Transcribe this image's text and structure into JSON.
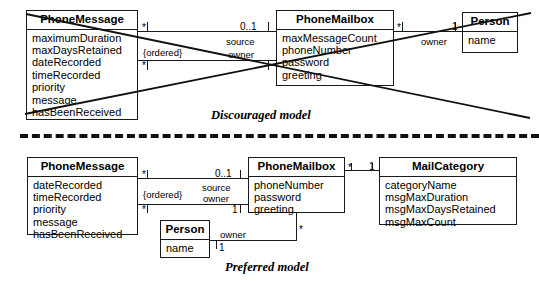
{
  "diagram": {
    "top": {
      "caption": "Discouraged model",
      "classes": [
        {
          "name": "PhoneMessage",
          "attributes": [
            "maximumDuration",
            "maxDaysRetained",
            "dateRecorded",
            "timeRecorded",
            "priority",
            "message",
            "hasBeenReceived"
          ]
        },
        {
          "name": "PhoneMailbox",
          "attributes": [
            "maxMessageCount",
            "phoneNumber",
            "password",
            "greeting"
          ]
        },
        {
          "name": "Person",
          "attributes": [
            "name"
          ]
        }
      ],
      "edge_labels": {
        "ordered": "{ordered}",
        "source": "source",
        "owner": "owner",
        "owner2": "owner"
      },
      "multiplicities": {
        "msg_star_top": "*",
        "msg_star_bottom": "*",
        "mailbox_source": "0..1",
        "mailbox_owner": "1",
        "mailbox_star": "*",
        "person_one": "1"
      }
    },
    "bottom": {
      "caption": "Preferred model",
      "classes": [
        {
          "name": "PhoneMessage",
          "attributes": [
            "dateRecorded",
            "timeRecorded",
            "priority",
            "message",
            "hasBeenReceived"
          ]
        },
        {
          "name": "PhoneMailbox",
          "attributes": [
            "phoneNumber",
            "password",
            "greeting"
          ]
        },
        {
          "name": "Person",
          "attributes": [
            "name"
          ]
        },
        {
          "name": "MailCategory",
          "attributes": [
            "categoryName",
            "msgMaxDuration",
            "msgMaxDaysRetained",
            "msgMaxCount"
          ]
        }
      ],
      "edge_labels": {
        "ordered": "{ordered}",
        "source": "source",
        "owner": "owner",
        "person_owner": "owner"
      },
      "multiplicities": {
        "msg_star_top": "*",
        "msg_star_bottom": "*",
        "mailbox_source": "0..1",
        "mailbox_owner": "1",
        "mailbox_star_right": "*",
        "mailbox_star_bottom": "*",
        "category_one": "1",
        "person_one": "1"
      }
    }
  },
  "colors": {
    "line": "#1a1a1a",
    "background": "#ffffff",
    "strike": "#111111"
  }
}
